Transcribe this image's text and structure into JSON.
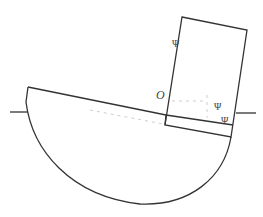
{
  "diagram": {
    "labels": {
      "origin": "O",
      "psi_mast": "Ψ",
      "psi_upper": "Ψ",
      "psi_lower": "Ψ"
    },
    "colors": {
      "stroke": "#333333",
      "faint": "#c8c8c8",
      "background": "#ffffff"
    }
  }
}
